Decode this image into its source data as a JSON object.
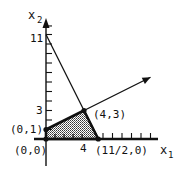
{
  "diagram": {
    "type": "linear-programming-feasible-region",
    "axes": {
      "x_label": "x",
      "x_subscript": "1",
      "y_label": "x",
      "y_subscript": "2",
      "x_range": [
        0,
        11.5
      ],
      "y_range": [
        0,
        12
      ]
    },
    "tick_labels": {
      "y_11": "11",
      "y_3": "3",
      "x_4": "4"
    },
    "feasible_region": {
      "vertices": [
        [
          0,
          0
        ],
        [
          0,
          1
        ],
        [
          4,
          3
        ],
        [
          5.5,
          0
        ]
      ],
      "fill": "#9a9a9a"
    },
    "constraint_lines": [
      {
        "name": "line-through-0-11-and-4-3",
        "from": [
          0,
          11
        ],
        "to": [
          5.5,
          0
        ]
      },
      {
        "name": "ray-from-0-1-through-4-3",
        "from": [
          0,
          1
        ],
        "to": [
          11,
          6.5
        ]
      }
    ],
    "point_labels": [
      {
        "id": "p01",
        "text": "(0,1)",
        "at": [
          0,
          1
        ]
      },
      {
        "id": "p00",
        "text": "(0,0)",
        "at": [
          0,
          0
        ]
      },
      {
        "id": "p43",
        "text": "(4,3)",
        "at": [
          4,
          3
        ]
      },
      {
        "id": "p1120",
        "text": "(11/2,0)",
        "at": [
          5.5,
          0
        ]
      }
    ],
    "colors": {
      "ink": "#111111",
      "shade": "#9a9a9a"
    }
  }
}
